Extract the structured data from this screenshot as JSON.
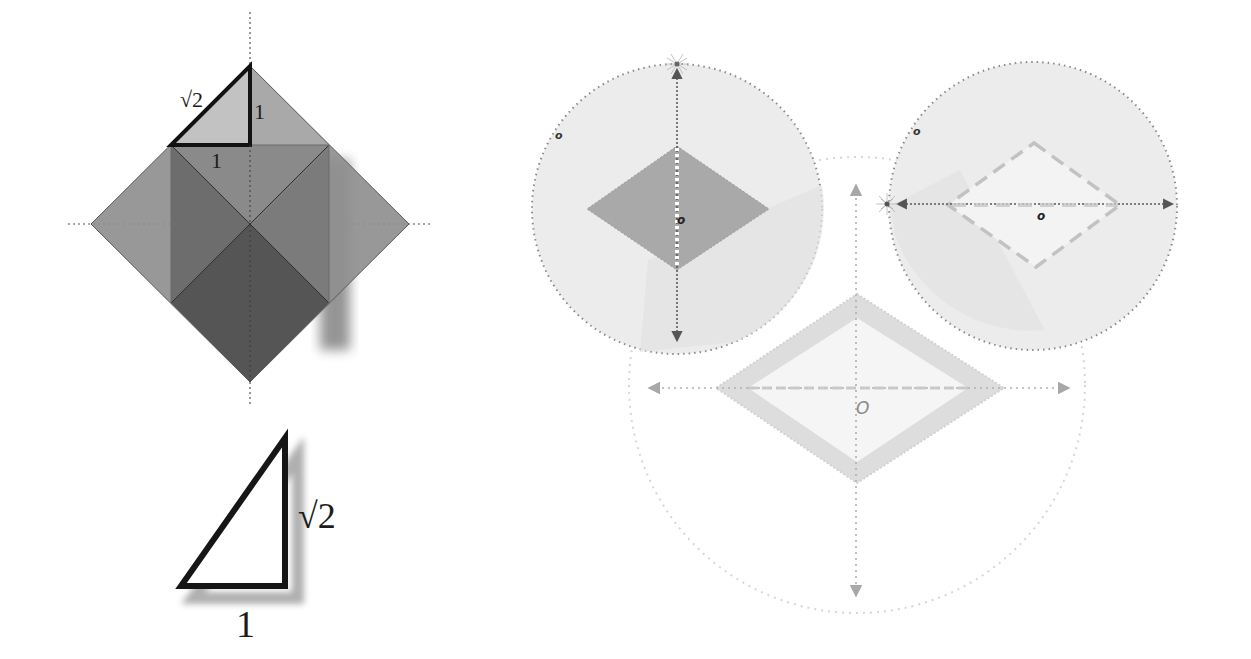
{
  "figure": {
    "left_panel": {
      "square_diagram": {
        "triangle_labels": {
          "hypotenuse": "√2",
          "vertical_leg": "1",
          "horizontal_leg": "1"
        }
      },
      "standalone_triangle": {
        "labels": {
          "vertical_side": "√2",
          "bottom_side": "1"
        }
      }
    },
    "right_panel": {
      "top_left_circle": {
        "corner_label": "o",
        "center_label": "o"
      },
      "top_right_circle": {
        "corner_label": "o",
        "center_label": "o"
      },
      "bottom_circle": {
        "center_label": "O"
      }
    }
  },
  "colors": {
    "background": "#ffffff",
    "square_light": "#9a9a9a",
    "square_mid": "#7c7c7c",
    "square_dark": "#595959",
    "triangle_fill": "#b9b9b9",
    "triangle_stroke": "#151515",
    "circle_fill": "#ececec",
    "circle_fill_shade": "#e2e2e2",
    "dotted_stroke": "#8a8a8a",
    "rhombus_dark": "#a9a9a9",
    "rhombus_light": "#f4f4f4",
    "rhombus_band": "#dcdcdc",
    "faint_stroke": "#cfcfcf"
  }
}
